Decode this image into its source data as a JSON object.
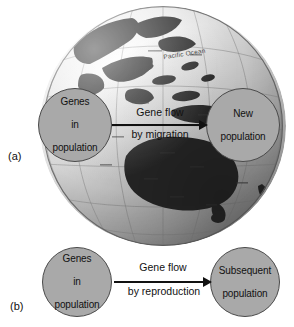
{
  "figure": {
    "panels": [
      {
        "letter": "(a)",
        "source_node": "Genes\nin\npopulation",
        "source_line1": "Genes",
        "source_line2": "in",
        "source_line3": "population",
        "target_line1": "New",
        "target_line2": "population",
        "arrow_label_top": "Gene flow",
        "arrow_label_bottom": "by migration",
        "background": "globe-photograph"
      },
      {
        "letter": "(b)",
        "source_line1": "Genes",
        "source_line2": "in",
        "source_line3": "population",
        "target_line1": "Subsequent",
        "target_line2": "population",
        "arrow_label_top": "Gene flow",
        "arrow_label_bottom": "by reproduction",
        "background": "white"
      }
    ],
    "globe": {
      "ocean_label": "Pacific Ocean",
      "region": "Australia and Southeast Asia",
      "style": "grayscale-photo"
    },
    "colors": {
      "node_fill": "#a9a9a9",
      "node_stroke": "#4a4a4a",
      "arrow": "#111111",
      "text": "#111111",
      "page_background": "#ffffff",
      "land": "#2e2e2e",
      "ocean": "#e8e8e8"
    }
  }
}
